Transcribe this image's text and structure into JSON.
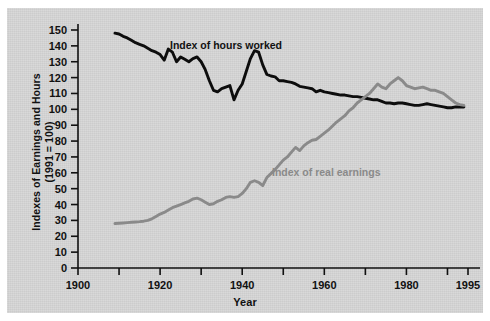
{
  "chart_data": {
    "type": "line",
    "title": "",
    "xlabel": "Year",
    "ylabel": "Indexes of Earnings and Hours\n(1991 = 100)",
    "xlim": [
      1900,
      1995
    ],
    "ylim": [
      0,
      150
    ],
    "grid": false,
    "legend_position": "inline-annotations",
    "xticks": [
      1900,
      1920,
      1940,
      1960,
      1980,
      1995
    ],
    "xtick_labels": [
      "1900",
      "1920",
      "1940",
      "1960",
      "1980",
      "1995"
    ],
    "xminor_ticks": [
      1910,
      1930,
      1950,
      1970,
      1990
    ],
    "yticks": [
      0,
      10,
      20,
      30,
      40,
      50,
      60,
      70,
      80,
      90,
      100,
      110,
      120,
      130,
      140,
      150
    ],
    "ytick_labels": [
      "0",
      "10",
      "20",
      "30",
      "40",
      "50",
      "60",
      "70",
      "80",
      "90",
      "100",
      "110",
      "120",
      "130",
      "140",
      "150"
    ],
    "colors": {
      "hours": "#0d0d0d",
      "earnings": "#8a8a8a",
      "panel_background": "#d7d7d7",
      "axis": "#111111"
    },
    "series": [
      {
        "name": "Index of hours worked",
        "color": "#0d0d0d",
        "label_x": 1934,
        "label_y": 143,
        "x": [
          1909,
          1910,
          1911,
          1912,
          1913,
          1914,
          1915,
          1916,
          1917,
          1918,
          1919,
          1920,
          1921,
          1922,
          1923,
          1924,
          1925,
          1926,
          1927,
          1928,
          1929,
          1930,
          1931,
          1932,
          1933,
          1934,
          1935,
          1936,
          1937,
          1938,
          1939,
          1940,
          1941,
          1942,
          1943,
          1944,
          1945,
          1946,
          1947,
          1948,
          1949,
          1950,
          1951,
          1952,
          1953,
          1954,
          1955,
          1956,
          1957,
          1958,
          1959,
          1960,
          1961,
          1962,
          1963,
          1964,
          1965,
          1966,
          1967,
          1968,
          1969,
          1970,
          1971,
          1972,
          1973,
          1974,
          1975,
          1976,
          1977,
          1978,
          1979,
          1980,
          1981,
          1982,
          1983,
          1984,
          1985,
          1986,
          1987,
          1988,
          1989,
          1990,
          1991,
          1992,
          1993,
          1994
        ],
        "y": [
          148,
          147.5,
          146,
          145,
          143.5,
          142,
          141,
          140,
          138.5,
          137,
          136,
          134.5,
          131,
          138,
          136,
          130,
          133,
          131.5,
          130,
          132,
          133,
          130,
          125,
          118,
          112,
          111,
          113,
          114,
          115,
          106,
          112,
          116,
          124,
          132,
          137,
          136,
          128,
          122,
          121,
          120.5,
          118,
          118,
          117.5,
          117,
          116,
          114.5,
          114,
          113.5,
          113,
          111,
          112,
          111,
          110.5,
          110,
          109.5,
          109,
          109,
          108.5,
          108,
          108,
          107.5,
          107,
          106.5,
          106,
          106,
          105,
          104,
          104,
          103.5,
          104,
          104,
          103.5,
          103,
          102.5,
          102.5,
          103,
          103.5,
          103,
          102.5,
          102,
          101.5,
          101,
          101,
          101.5,
          101.5,
          101.5
        ]
      },
      {
        "name": "Index of real earnings",
        "color": "#8a8a8a",
        "label_x": 1962,
        "label_y": 62,
        "x": [
          1909,
          1910,
          1911,
          1912,
          1913,
          1914,
          1915,
          1916,
          1917,
          1918,
          1919,
          1920,
          1921,
          1922,
          1923,
          1924,
          1925,
          1926,
          1927,
          1928,
          1929,
          1930,
          1931,
          1932,
          1933,
          1934,
          1935,
          1936,
          1937,
          1938,
          1939,
          1940,
          1941,
          1942,
          1943,
          1944,
          1945,
          1946,
          1947,
          1948,
          1949,
          1950,
          1951,
          1952,
          1953,
          1954,
          1955,
          1956,
          1957,
          1958,
          1959,
          1960,
          1961,
          1962,
          1963,
          1964,
          1965,
          1966,
          1967,
          1968,
          1969,
          1970,
          1971,
          1972,
          1973,
          1974,
          1975,
          1976,
          1977,
          1978,
          1979,
          1980,
          1981,
          1982,
          1983,
          1984,
          1985,
          1986,
          1987,
          1988,
          1989,
          1990,
          1991,
          1992,
          1993,
          1994
        ],
        "y": [
          28,
          28.2,
          28.4,
          28.6,
          28.8,
          29,
          29.2,
          29.5,
          30,
          31,
          32.5,
          34,
          35,
          36.5,
          38,
          39,
          40,
          41,
          42,
          43.5,
          44,
          43,
          41.5,
          40,
          40.5,
          42,
          43,
          44.5,
          45,
          44.5,
          45,
          47,
          50,
          54,
          55,
          54,
          52,
          57,
          59.5,
          62,
          65,
          68,
          70,
          73,
          76,
          74,
          77,
          79,
          80.5,
          81,
          83,
          85,
          87,
          89.5,
          92,
          94,
          96,
          99,
          101,
          104,
          106,
          108,
          110,
          113,
          116,
          114,
          113,
          116,
          118,
          120,
          118,
          115,
          114,
          113,
          113.5,
          114,
          113,
          112,
          112,
          111,
          110,
          108,
          106,
          104,
          103,
          102.5
        ]
      }
    ]
  },
  "annotations": {
    "hours_label": "Index of hours worked",
    "earnings_label": "Index of real earnings"
  },
  "axis_titles": {
    "x": "Year",
    "y_line1": "Indexes of Earnings and Hours",
    "y_line2": "(1991 = 100)"
  }
}
